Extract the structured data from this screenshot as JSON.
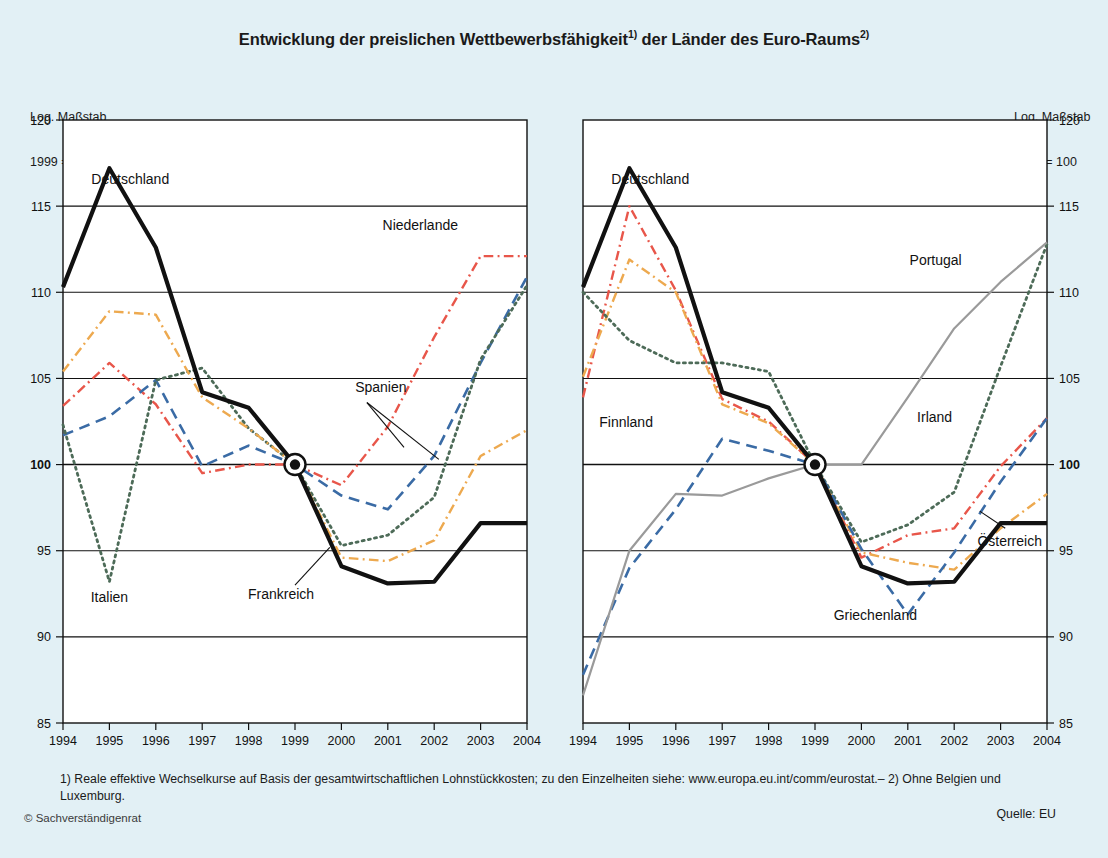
{
  "header": {
    "title_main": "Entwicklung der preislichen Wettbewerbsfähigkeit",
    "title_sup1": "1)",
    "title_mid": " der Länder des Euro-Raums",
    "title_sup2": "2)"
  },
  "axis_note": {
    "line1": "Log. Maßstab",
    "line2": "1999 = 100"
  },
  "footnote": {
    "text": "1) Reale effektive Wechselkurse auf Basis der gesamtwirtschaftlichen Lohnstückkosten; zu den Einzelheiten siehe: www.europa.eu.int/comm/eurostat.– 2) Ohne Belgien und Luxemburg.",
    "source": "Quelle: EU",
    "copyright": "© Sachverständigenrat"
  },
  "colors": {
    "background": "#e2f0f5",
    "plot_background": "#ffffff",
    "black": "#111111",
    "red": "#e8564a",
    "blue": "#3a6ba5",
    "green": "#4d6b58",
    "orange": "#eda94f",
    "gray": "#9a9a9a"
  },
  "chart_data": [
    {
      "id": "left-panel",
      "type": "line",
      "title": "",
      "xlabel": "",
      "ylabel": "Log. Maßstab 1999 = 100",
      "x": [
        1994,
        1995,
        1996,
        1997,
        1998,
        1999,
        2000,
        2001,
        2002,
        2003,
        2004
      ],
      "xticklabels": [
        "1994",
        "1995",
        "1996",
        "1997",
        "1998",
        "1999",
        "2000",
        "2001",
        "2002",
        "2003",
        "2004"
      ],
      "ylim": [
        85,
        120
      ],
      "yticks": [
        85,
        90,
        95,
        100,
        105,
        110,
        115,
        120
      ],
      "yticklabels": [
        "85",
        "90",
        "95",
        "100",
        "105",
        "110",
        "115",
        "120"
      ],
      "grid": true,
      "legend": "inline-annotations",
      "series": [
        {
          "name": "Deutschland",
          "color": "#111111",
          "style": "solid",
          "width": 4.2,
          "values": [
            110.3,
            117.2,
            112.6,
            104.2,
            103.3,
            100.0,
            94.1,
            93.1,
            93.2,
            96.6,
            96.6
          ],
          "label_x": 1995.45,
          "label_y": 116.3
        },
        {
          "name": "Niederlande",
          "color": "#e8564a",
          "style": "dashdot",
          "width": 2.4,
          "values": [
            103.4,
            105.9,
            103.5,
            99.5,
            100.0,
            100.0,
            98.8,
            102.2,
            107.4,
            112.1,
            112.1
          ],
          "label_x": 2001.7,
          "label_y": 113.6
        },
        {
          "name": "Spanien",
          "color": "#3a6ba5",
          "style": "dashed",
          "width": 2.6,
          "values": [
            101.7,
            102.8,
            104.9,
            99.9,
            101.1,
            100.0,
            98.2,
            97.4,
            100.5,
            105.9,
            110.9
          ],
          "label_x": 2000.85,
          "label_y": 104.2
        },
        {
          "name": "Italien",
          "color": "#4d6b58",
          "style": "dotted",
          "width": 2.8,
          "values": [
            102.3,
            93.2,
            104.9,
            105.6,
            102.1,
            100.0,
            95.3,
            95.9,
            98.1,
            106.1,
            110.4
          ],
          "label_x": 1995.0,
          "label_y": 92.0
        },
        {
          "name": "Frankreich",
          "color": "#eda94f",
          "style": "dashdot",
          "width": 2.4,
          "values": [
            105.4,
            108.9,
            108.7,
            103.9,
            102.1,
            100.0,
            94.6,
            94.4,
            95.6,
            100.5,
            102.0
          ],
          "label_x": 1998.7,
          "label_y": 92.2
        }
      ],
      "marker_1999": {
        "x": 1999,
        "y": 100,
        "style": "bullseye"
      }
    },
    {
      "id": "right-panel",
      "type": "line",
      "title": "",
      "xlabel": "",
      "ylabel": "Log. Maßstab 1999 = 100",
      "x": [
        1994,
        1995,
        1996,
        1997,
        1998,
        1999,
        2000,
        2001,
        2002,
        2003,
        2004
      ],
      "xticklabels": [
        "1994",
        "1995",
        "1996",
        "1997",
        "1998",
        "1999",
        "2000",
        "2001",
        "2002",
        "2003",
        "2004"
      ],
      "ylim": [
        85,
        120
      ],
      "yticks": [
        85,
        90,
        95,
        100,
        105,
        110,
        115,
        120
      ],
      "yticklabels": [
        "85",
        "90",
        "95",
        "100",
        "105",
        "110",
        "115",
        "120"
      ],
      "grid": true,
      "legend": "inline-annotations",
      "series": [
        {
          "name": "Deutschland",
          "color": "#111111",
          "style": "solid",
          "width": 4.2,
          "values": [
            110.3,
            117.2,
            112.6,
            104.2,
            103.3,
            100.0,
            94.1,
            93.1,
            93.2,
            96.6,
            96.6
          ],
          "label_x": 1995.45,
          "label_y": 116.3
        },
        {
          "name": "Finnland",
          "color": "#e8564a",
          "style": "dashdot",
          "width": 2.4,
          "values": [
            103.9,
            115.0,
            110.1,
            103.8,
            102.5,
            100.0,
            94.6,
            95.9,
            96.3,
            99.9,
            102.7
          ],
          "label_x": 1994.35,
          "label_y": 102.2
        },
        {
          "name": "Österreich",
          "color": "#eda94f",
          "style": "dashdot",
          "width": 2.4,
          "values": [
            105.1,
            111.9,
            110.0,
            103.5,
            102.4,
            100.0,
            94.9,
            94.3,
            93.9,
            96.3,
            98.3
          ],
          "label_x": 2002.5,
          "label_y": 95.3
        },
        {
          "name": "Irland",
          "color": "#4d6b58",
          "style": "dotted",
          "width": 2.8,
          "values": [
            110.0,
            107.2,
            105.9,
            105.9,
            105.4,
            100.0,
            95.5,
            96.5,
            98.4,
            105.7,
            112.8
          ],
          "label_x": 2001.2,
          "label_y": 102.5
        },
        {
          "name": "Griechenland",
          "color": "#3a6ba5",
          "style": "dashed",
          "width": 2.6,
          "values": [
            87.8,
            94.0,
            97.4,
            101.5,
            100.8,
            100.0,
            95.1,
            91.3,
            94.9,
            99.0,
            102.7
          ],
          "label_x": 2000.3,
          "label_y": 91.0
        },
        {
          "name": "Portugal",
          "color": "#9a9a9a",
          "style": "solid",
          "width": 2.2,
          "values": [
            86.6,
            95.0,
            98.3,
            98.2,
            99.2,
            100.0,
            100.0,
            103.9,
            107.9,
            110.6,
            112.9
          ],
          "label_x": 2001.6,
          "label_y": 111.6
        }
      ],
      "marker_1999": {
        "x": 1999,
        "y": 100,
        "style": "bullseye"
      }
    }
  ]
}
